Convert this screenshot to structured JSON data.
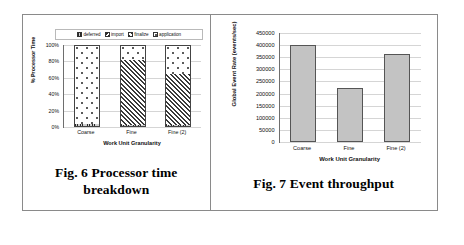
{
  "figures": [
    {
      "id": "fig6",
      "caption_line1": "Fig. 6  Processor time",
      "caption_line2": "breakdown"
    },
    {
      "id": "fig7",
      "caption_line1": "Fig. 7 Event throughput"
    }
  ],
  "chart_data": [
    {
      "type": "bar",
      "stacked": true,
      "title": "",
      "xlabel": "Work Unit Granularity",
      "ylabel": "% Processor Time",
      "categories": [
        "Coarse",
        "Fine",
        "Fine (2)"
      ],
      "ytick_labels": [
        "100%",
        "80%",
        "60%",
        "40%",
        "20%",
        "0%"
      ],
      "ytick_values": [
        100,
        80,
        60,
        40,
        20,
        0
      ],
      "ylim": [
        0,
        100
      ],
      "grid": true,
      "legend_position": "top",
      "series": [
        {
          "name": "deferred",
          "values": [
            3,
            1,
            1
          ]
        },
        {
          "name": "import",
          "values": [
            0,
            0,
            0
          ]
        },
        {
          "name": "finalize",
          "values": [
            0,
            81,
            64
          ]
        },
        {
          "name": "application",
          "values": [
            97,
            18,
            35
          ]
        }
      ]
    },
    {
      "type": "bar",
      "stacked": false,
      "title": "",
      "xlabel": "Work Unit Granularity",
      "ylabel": "Global Event Rate (events/sec)",
      "categories": [
        "Coarse",
        "Fine",
        "Fine (2)"
      ],
      "ytick_labels": [
        "450000",
        "400000",
        "350000",
        "300000",
        "250000",
        "200000",
        "150000",
        "100000",
        "50000",
        "0"
      ],
      "ytick_values": [
        450000,
        400000,
        350000,
        300000,
        250000,
        200000,
        150000,
        100000,
        50000,
        0
      ],
      "ylim": [
        0,
        450000
      ],
      "grid": true,
      "values": [
        400000,
        225000,
        365000
      ]
    }
  ],
  "colors": {
    "bar_fill": "#c3c3c3",
    "bar_stroke": "#555555",
    "gridline": "#d5d5d5",
    "axis": "#6e6e6e",
    "table_border": "#8a8a8a",
    "text": "#111111"
  }
}
